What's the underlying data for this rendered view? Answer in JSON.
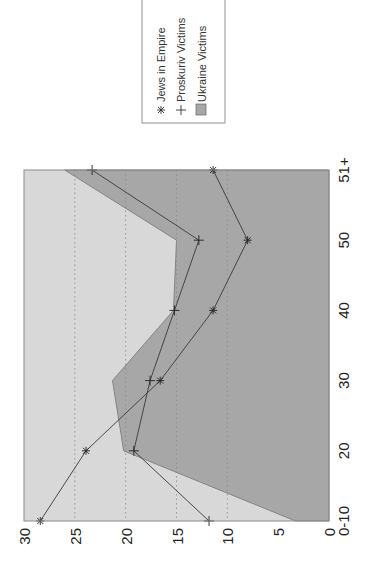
{
  "chart_data": {
    "type": "line",
    "orientation": "rotated-90-ccw",
    "title": "",
    "xlabel": "",
    "ylabel": "",
    "categories": [
      "0-10",
      "20",
      "30",
      "40",
      "50",
      "51+"
    ],
    "ylim": [
      0,
      30
    ],
    "yticks": [
      0,
      5,
      10,
      15,
      20,
      25,
      30
    ],
    "grid": {
      "y_dotted": [
        10,
        15,
        20,
        25
      ]
    },
    "legend_position": "outside-right (top of rotated image)",
    "series": [
      {
        "name": "Jews in Empire",
        "kind": "line",
        "marker": "asterisk",
        "values": [
          28.4,
          23.9,
          16.6,
          11.4,
          8.0,
          11.4
        ]
      },
      {
        "name": "Proskuriv Victims",
        "kind": "line",
        "marker": "plus",
        "values": [
          11.8,
          19.2,
          17.6,
          15.2,
          12.8,
          23.3
        ]
      },
      {
        "name": "Ukraine Victims",
        "kind": "area",
        "values": [
          3.3,
          20.2,
          21.3,
          15.3,
          15.0,
          26.0
        ]
      }
    ]
  },
  "legend": {
    "items": [
      {
        "label": "Jews in Empire",
        "marker": "asterisk-icon"
      },
      {
        "label": "Proskuriv Victims",
        "marker": "plus-icon"
      },
      {
        "label": "Ukraine Victims",
        "marker": "filled-square-icon"
      }
    ]
  },
  "colors": {
    "plot_background": "#d8d8d8",
    "area_fill": "#a7a7a7",
    "line": "#3a3a3a",
    "grid": "#8a8a8a",
    "axis_frame": "#8c8c8c"
  }
}
